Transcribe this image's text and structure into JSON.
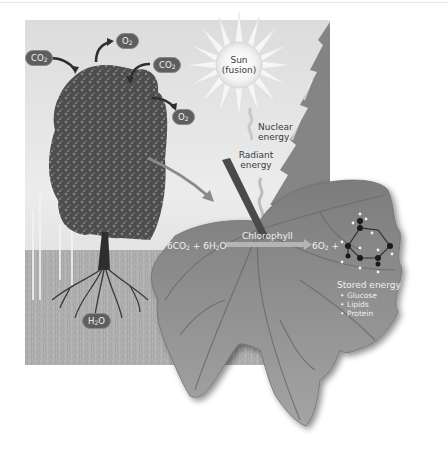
{
  "figure": {
    "tree_labels": {
      "co2_left": "CO2",
      "o2_top": "O2",
      "co2_right": "CO2",
      "o2_right": "O2",
      "h2o_root": "H2O"
    },
    "sun": {
      "line1": "Sun",
      "line2": "(fusion)"
    },
    "energy_labels": {
      "nuclear_line1": "Nuclear",
      "nuclear_line2": "energy",
      "radiant_line1": "Radiant",
      "radiant_line2": "energy"
    },
    "equation": {
      "reactants": "6CO2 + 6H2O",
      "catalyst": "Chlorophyll",
      "products": "6O2 +"
    },
    "stored_energy": {
      "title": "Stored energy",
      "items": [
        "Glucose",
        "Lipids",
        "Protein"
      ]
    },
    "colors": {
      "sky": "#e4e4e4",
      "leaf": "#8a8a8a",
      "leaf_vein": "#6f6f6f",
      "tree": "#4a4a4a",
      "arrow": "#3a3a3a",
      "pill": "#5e5e5e"
    }
  }
}
